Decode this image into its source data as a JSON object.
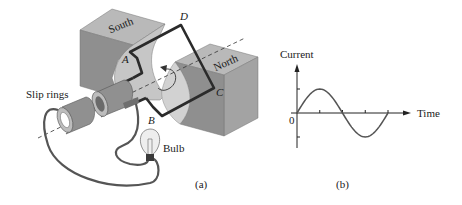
{
  "figure_a": {
    "caption": "(a)",
    "labels": {
      "south": "South",
      "north": "North",
      "slip_rings": "Slip rings",
      "bulb": "Bulb",
      "corner_a": "A",
      "corner_b": "B",
      "corner_c": "C",
      "corner_d": "D"
    }
  },
  "figure_b": {
    "caption": "(b)",
    "y_label": "Current",
    "x_label": "Time",
    "origin_label": "0"
  },
  "chart_data": {
    "type": "line",
    "title": "",
    "xlabel": "Time",
    "ylabel": "Current",
    "x": [
      0,
      0.125,
      0.25,
      0.375,
      0.5,
      0.625,
      0.75,
      0.875,
      1.0
    ],
    "series": [
      {
        "name": "current",
        "values": [
          0,
          0.707,
          1,
          0.707,
          0,
          -0.707,
          -1,
          -0.707,
          0
        ]
      }
    ],
    "x_ticks": [
      0.25,
      0.5,
      0.75,
      1.0
    ],
    "y_ticks": [
      1,
      -1
    ],
    "ylim": [
      -1.4,
      1.9
    ],
    "xlim": [
      0,
      1.65
    ],
    "grid": false
  },
  "colors": {
    "magnet_top": "#b9b9b9",
    "magnet_front": "#8f8f8f",
    "magnet_side": "#a6a6a6",
    "magnet_curve": "#c9c9c9",
    "wire": "#2b2b2b",
    "ring": "#8a8a8a",
    "bulb_glass": "#eeeeee",
    "text": "#1a1a1a"
  }
}
